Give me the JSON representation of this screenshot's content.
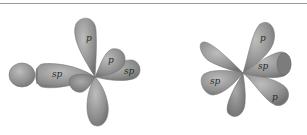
{
  "diagram": {
    "colors": {
      "lobe_fill": "#8e8e8e",
      "lobe_light": "#b4b4b4",
      "lobe_dark": "#6a6a6a",
      "rule": "#9a9a9a"
    },
    "left_view": {
      "labels": {
        "p_top": "p",
        "p_side": "p",
        "sp_left": "sp",
        "sp_right": "sp"
      }
    },
    "right_view": {
      "labels": {
        "p_top": "p",
        "sp_center": "sp",
        "sp_left": "sp",
        "p_bottom": "p"
      }
    }
  }
}
